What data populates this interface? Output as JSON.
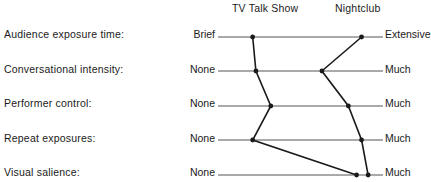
{
  "header": {
    "series_a": "TV Talk Show",
    "series_b": "Nightclub"
  },
  "rows": [
    {
      "label": "Audience exposure time:",
      "low": "Brief",
      "high": "Extensive"
    },
    {
      "label": "Conversational intensity:",
      "low": "None",
      "high": "Much"
    },
    {
      "label": "Performer control:",
      "low": "None",
      "high": "Much"
    },
    {
      "label": "Repeat exposures:",
      "low": "None",
      "high": "Much"
    },
    {
      "label": "Visual salience:",
      "low": "None",
      "high": "Much"
    }
  ],
  "profiles": {
    "tv_talk_show": [
      0.21,
      0.23,
      0.32,
      0.21,
      0.84
    ],
    "nightclub": [
      0.87,
      0.63,
      0.79,
      0.87,
      0.91
    ]
  },
  "colors": {
    "line": "#1a1a1a",
    "axis": "#555555"
  }
}
